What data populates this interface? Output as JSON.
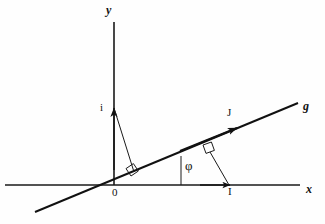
{
  "figure": {
    "kind": "geometry-diagram",
    "background_color": "#fefefe",
    "ink_color": "#111111"
  },
  "axes": {
    "x": {
      "label": "x",
      "label_pos": {
        "x": 306,
        "y": 184
      },
      "line": {
        "x1": 5,
        "y1": 185,
        "x2": 300,
        "y2": 185
      },
      "arrow_at": {
        "x": 229,
        "y": 185
      }
    },
    "y": {
      "label": "y",
      "label_pos": {
        "x": 107,
        "y": 5
      },
      "line": {
        "x1": 114,
        "y1": 22,
        "x2": 114,
        "y2": 185
      }
    }
  },
  "origin": {
    "label": "0",
    "label_pos": {
      "x": 113,
      "y": 187
    },
    "point": {
      "x": 114,
      "y": 185
    }
  },
  "line_g": {
    "label": "g",
    "label_pos": {
      "x": 303,
      "y": 100
    },
    "segment": {
      "x1": 35,
      "y1": 212,
      "x2": 298,
      "y2": 103
    },
    "slope_note": "rises to the right through the origin",
    "arrow_at": {
      "x": 236,
      "y": 128
    }
  },
  "vectors": [
    {
      "name": "i",
      "label": "i",
      "label_pos": {
        "x": 101,
        "y": 103
      },
      "tail": {
        "x": 114,
        "y": 185
      },
      "tip": {
        "x": 114,
        "y": 107
      },
      "direction": "vertical-up-along-y-axis"
    },
    {
      "name": "J",
      "label": "J",
      "label_pos": {
        "x": 228,
        "y": 108
      },
      "tail": {
        "x": 114,
        "y": 185
      },
      "tip": {
        "x": 236,
        "y": 128
      },
      "direction": "along-line-g"
    }
  ],
  "points": [
    {
      "name": "I",
      "label": "I",
      "label_pos": {
        "x": 229,
        "y": 187
      },
      "point": {
        "x": 229,
        "y": 185
      },
      "on": "x-axis"
    }
  ],
  "angle": {
    "label": "φ",
    "label_pos": {
      "x": 185,
      "y": 160
    },
    "vertex": {
      "x": 114,
      "y": 185
    },
    "between": [
      "x-axis",
      "line g"
    ],
    "tick_line": {
      "x1": 181,
      "y1": 185,
      "x2": 181,
      "y2": 157
    }
  },
  "construction_lines": [
    {
      "name": "perpendicular-from-i-tip-to-g",
      "from": {
        "x": 114,
        "y": 107
      },
      "to": {
        "x": 134,
        "y": 172
      }
    },
    {
      "name": "perpendicular-from-I-to-g",
      "from": {
        "x": 229,
        "y": 185
      },
      "to": {
        "x": 210,
        "y": 152
      }
    }
  ],
  "right_angle_marks": [
    {
      "name": "right-angle-near-origin",
      "at": {
        "x": 134,
        "y": 172
      },
      "note": "between segment i-foot and line g"
    },
    {
      "name": "right-angle-near-J",
      "at": {
        "x": 210,
        "y": 152
      },
      "note": "between segment I-foot and line g"
    }
  ]
}
